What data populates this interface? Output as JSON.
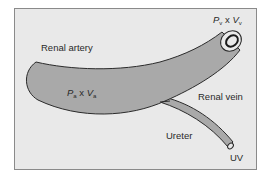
{
  "diagram": {
    "type": "anatomical schematic",
    "labels": {
      "renal_artery": "Renal artery",
      "renal_vein": "Renal vein",
      "ureter": "Ureter",
      "arterial_flux": {
        "p": "P",
        "p_sub": "a",
        "x": " x ",
        "v": "V",
        "v_sub": "a"
      },
      "venous_flux": {
        "p": "P",
        "p_sub": "v",
        "x": " x ",
        "v": "V",
        "v_sub": "v"
      },
      "urine": "UV"
    },
    "colors": {
      "background": "#e9e9e9",
      "vessel_fill": "#a9a9a9",
      "outline": "#2b2b2b",
      "text": "#2a2a2a"
    }
  }
}
